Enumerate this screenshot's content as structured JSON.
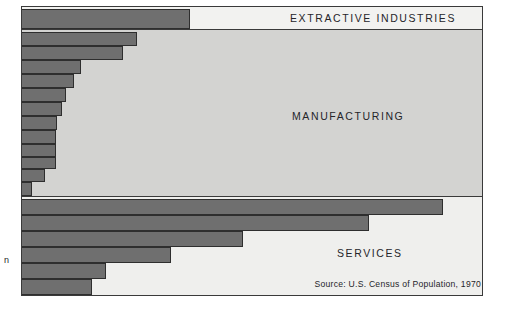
{
  "figure": {
    "source_note": "Source:  U.S. Census of Population, 1970",
    "caption_fragment": "n"
  },
  "bands": [
    {
      "id": "extractive",
      "label": "EXTRACTIVE INDUSTRIES"
    },
    {
      "id": "manufacturing",
      "label": "MANUFACTURING"
    },
    {
      "id": "services",
      "label": "SERVICES"
    }
  ],
  "colors": {
    "bar": "#6f6f6f",
    "bar_outline": "#2e2e2e",
    "frame": "#3a3a3a",
    "band_extractive_bg": "#f2f2f0",
    "band_manufacturing_bg": "#d3d3d1",
    "band_services_bg": "#efefed",
    "text": "#25252a"
  },
  "chart_data": {
    "type": "bar",
    "orientation": "horizontal",
    "title": "",
    "subtitle": "",
    "xlabel": "",
    "ylabel": "",
    "grid": false,
    "legend": null,
    "note": "Horizontal bar lengths are read as a percentage of the plot width (0-100).",
    "xlim": [
      0,
      100
    ],
    "groups": [
      {
        "name": "EXTRACTIVE INDUSTRIES",
        "categories": [
          "E1"
        ],
        "values": [
          36.6
        ]
      },
      {
        "name": "MANUFACTURING",
        "categories": [
          "M1",
          "M2",
          "M3",
          "M4",
          "M5",
          "M6",
          "M7",
          "M8",
          "M9",
          "M10",
          "M11",
          "M12"
        ],
        "values": [
          25.0,
          21.9,
          12.8,
          11.3,
          9.5,
          8.7,
          7.6,
          7.4,
          7.4,
          7.4,
          5.0,
          2.2
        ]
      },
      {
        "name": "SERVICES",
        "categories": [
          "S1",
          "S2",
          "S3",
          "S4",
          "S5",
          "S6"
        ],
        "values": [
          91.8,
          75.6,
          48.1,
          32.5,
          18.2,
          15.2
        ]
      }
    ]
  },
  "bars": [
    {
      "name": "bar-extractive-1",
      "group": "extractive",
      "top": 2,
      "height": 20,
      "width_pct": 36.6
    },
    {
      "name": "bar-manufacturing-1",
      "group": "manufacturing",
      "top": 25,
      "height": 14,
      "width_pct": 25.0
    },
    {
      "name": "bar-manufacturing-2",
      "group": "manufacturing",
      "top": 39,
      "height": 14,
      "width_pct": 21.9
    },
    {
      "name": "bar-manufacturing-3",
      "group": "manufacturing",
      "top": 53,
      "height": 14,
      "width_pct": 12.8
    },
    {
      "name": "bar-manufacturing-4",
      "group": "manufacturing",
      "top": 67,
      "height": 14,
      "width_pct": 11.3
    },
    {
      "name": "bar-manufacturing-5",
      "group": "manufacturing",
      "top": 81,
      "height": 14,
      "width_pct": 9.5
    },
    {
      "name": "bar-manufacturing-6",
      "group": "manufacturing",
      "top": 95,
      "height": 14,
      "width_pct": 8.7
    },
    {
      "name": "bar-manufacturing-7",
      "group": "manufacturing",
      "top": 109,
      "height": 14,
      "width_pct": 7.6
    },
    {
      "name": "bar-manufacturing-8",
      "group": "manufacturing",
      "top": 123,
      "height": 14,
      "width_pct": 7.4
    },
    {
      "name": "bar-manufacturing-9",
      "group": "manufacturing",
      "top": 137,
      "height": 12.5,
      "width_pct": 7.4
    },
    {
      "name": "bar-manufacturing-10",
      "group": "manufacturing",
      "top": 149.5,
      "height": 12.5,
      "width_pct": 7.4
    },
    {
      "name": "bar-manufacturing-11",
      "group": "manufacturing",
      "top": 162,
      "height": 13,
      "width_pct": 5.0
    },
    {
      "name": "bar-manufacturing-12",
      "group": "manufacturing",
      "top": 175,
      "height": 14,
      "width_pct": 2.2
    },
    {
      "name": "bar-services-1",
      "group": "services",
      "top": 192,
      "height": 16,
      "width_pct": 91.8
    },
    {
      "name": "bar-services-2",
      "group": "services",
      "top": 208,
      "height": 16,
      "width_pct": 75.6
    },
    {
      "name": "bar-services-3",
      "group": "services",
      "top": 224,
      "height": 16,
      "width_pct": 48.1
    },
    {
      "name": "bar-services-4",
      "group": "services",
      "top": 240,
      "height": 16,
      "width_pct": 32.5
    },
    {
      "name": "bar-services-5",
      "group": "services",
      "top": 256,
      "height": 16,
      "width_pct": 18.2
    },
    {
      "name": "bar-services-6",
      "group": "services",
      "top": 272,
      "height": 16,
      "width_pct": 15.2
    }
  ]
}
